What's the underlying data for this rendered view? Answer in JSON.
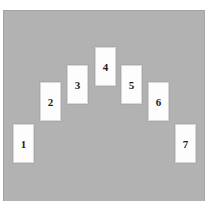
{
  "scene": {
    "title": "Arch arrangement of seven numbered cards",
    "background_color": "#ffffff",
    "panel_color": "#b2b2b2",
    "panel_border_color": "#a3a3a3",
    "card_color": "#fdfdfd",
    "card_border_color": "#d8d8d8",
    "label_color": "#1c1c1c"
  },
  "cards": [
    {
      "label": "1",
      "x": 13,
      "y": 124,
      "w": 21,
      "h": 39
    },
    {
      "label": "2",
      "x": 40,
      "y": 82,
      "w": 21,
      "h": 39
    },
    {
      "label": "3",
      "x": 67,
      "y": 65,
      "w": 21,
      "h": 39
    },
    {
      "label": "4",
      "x": 95,
      "y": 47,
      "w": 21,
      "h": 39
    },
    {
      "label": "5",
      "x": 121,
      "y": 65,
      "w": 21,
      "h": 39
    },
    {
      "label": "6",
      "x": 148,
      "y": 82,
      "w": 21,
      "h": 39
    },
    {
      "label": "7",
      "x": 175,
      "y": 124,
      "w": 21,
      "h": 39
    }
  ]
}
